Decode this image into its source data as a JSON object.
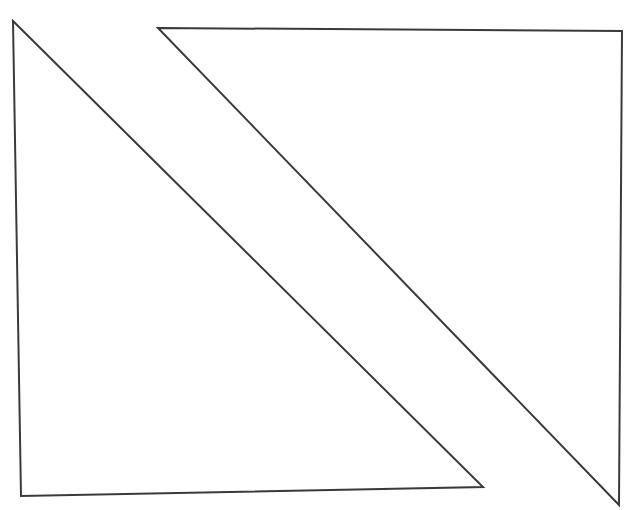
{
  "diagram": {
    "background": "#ffffff",
    "stroke_color": "#3a3a3a",
    "stroke_width": 2,
    "shapes": [
      {
        "name": "left-triangle",
        "points": "13,21 21,496 483,487"
      },
      {
        "name": "right-triangle",
        "points": "158,28 622,31 619,505"
      }
    ]
  }
}
